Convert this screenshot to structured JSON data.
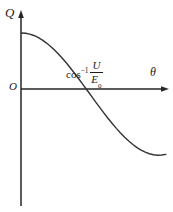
{
  "figure": {
    "axes": {
      "y_label": "Q",
      "x_label": "θ",
      "origin_label": "O"
    },
    "annotation": {
      "function_name": "cos",
      "exponent": "−1",
      "fraction_numerator": "U",
      "fraction_denominator_base": "E",
      "fraction_denominator_subscript": "0"
    },
    "colors": {
      "background": "#ffffff",
      "axis": "#262626",
      "curve": "#333333",
      "text": "#1a1a1a"
    }
  },
  "chart_data": {
    "type": "line",
    "title": "",
    "xlabel": "θ",
    "ylabel": "Q",
    "grid": false,
    "legend": false,
    "xlim": [
      0,
      3.6
    ],
    "ylim": [
      -1.3,
      1.15
    ],
    "annotations": [
      {
        "text": "cos⁻¹ U/E₀",
        "x": 1.1,
        "y": 0.25,
        "describes": "zero crossing of Q"
      },
      {
        "text": "O",
        "x": 0,
        "y": 0,
        "describes": "origin"
      }
    ],
    "series": [
      {
        "name": "Q(θ)",
        "x": [
          0.0,
          0.1,
          0.2,
          0.3,
          0.4,
          0.5,
          0.6,
          0.7,
          0.8,
          0.9,
          1.0,
          1.1,
          1.2,
          1.3,
          1.4,
          1.5,
          1.6,
          1.7,
          1.8,
          1.9,
          2.0,
          2.1,
          2.2,
          2.3,
          2.4,
          2.5,
          2.6,
          2.7,
          2.8,
          2.9,
          3.0,
          3.1,
          3.2,
          3.3,
          3.4,
          3.5
        ],
        "y": [
          0.77,
          0.766,
          0.755,
          0.736,
          0.71,
          0.676,
          0.635,
          0.589,
          0.536,
          0.478,
          0.416,
          0.35,
          0.279,
          0.206,
          0.131,
          0.054,
          -0.024,
          -0.102,
          -0.18,
          -0.257,
          -0.332,
          -0.405,
          -0.475,
          -0.541,
          -0.604,
          -0.662,
          -0.715,
          -0.763,
          -0.805,
          -0.84,
          -0.869,
          -0.89,
          -0.904,
          -0.91,
          -0.908,
          -0.899
        ]
      }
    ]
  }
}
